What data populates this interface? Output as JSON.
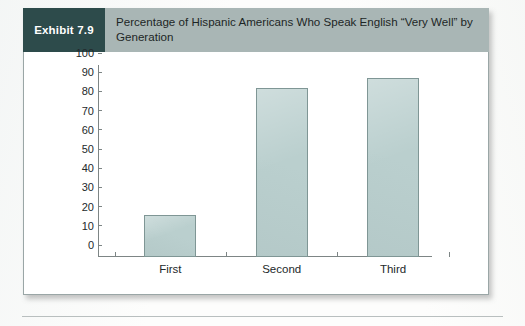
{
  "exhibit": {
    "badge_label": "Exhibit 7.9",
    "title": "Percentage of Hispanic Americans Who Speak English “Very Well” by Generation",
    "badge_color": "#2d4b4b",
    "header_color": "#a9b6b5"
  },
  "chart_data": {
    "type": "bar",
    "title": "Percentage of Hispanic Americans Who Speak English “Very Well” by Generation",
    "categories": [
      "First",
      "Second",
      "Third"
    ],
    "values": [
      22,
      88,
      93
    ],
    "series": [
      {
        "name": "Percentage who speak English “very well”",
        "values": [
          22,
          88,
          93
        ]
      }
    ],
    "xlabel": "",
    "ylabel": "",
    "ylim": [
      0,
      100
    ],
    "yticks": [
      0,
      10,
      20,
      30,
      40,
      50,
      60,
      70,
      80,
      90,
      100
    ],
    "ytick_labels": [
      "0",
      "10",
      "20",
      "30",
      "40",
      "50",
      "60",
      "70",
      "80",
      "90",
      "100"
    ],
    "grid": false,
    "legend": false,
    "bar_color": "#bacfce",
    "bar_edge_color": "#7f9695",
    "axis_color": "#7d8585"
  }
}
